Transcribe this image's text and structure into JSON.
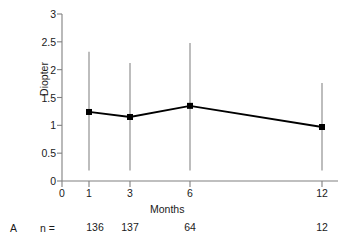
{
  "chart_data": {
    "type": "line",
    "title": "",
    "xlabel": "Months",
    "ylabel": "Diopter",
    "panel_label": "A",
    "x": [
      1,
      3,
      6,
      12
    ],
    "values": [
      1.24,
      1.15,
      1.35,
      0.97
    ],
    "error_low": [
      0.19,
      0.19,
      0.19,
      0.19
    ],
    "error_high": [
      2.32,
      2.12,
      2.48,
      1.76
    ],
    "xticks": [
      0,
      1,
      3,
      6,
      12
    ],
    "xtick_labels": [
      "0",
      "1",
      "3",
      "6",
      "12"
    ],
    "yticks": [
      0,
      0.5,
      1,
      1.5,
      2,
      2.5,
      3
    ],
    "ytick_labels": [
      "0",
      "0.5",
      "1",
      "1.5",
      "2",
      "2.5",
      "3"
    ],
    "xlim": [
      0,
      12
    ],
    "ylim": [
      0,
      3
    ],
    "grid": false,
    "legend": null,
    "marker": "square",
    "line_color": "#000000",
    "errorbar_color": "#9a9a9a",
    "axis_color": "#808080",
    "n_label_prefix": "n =",
    "n_counts": [
      "136",
      "137",
      "64",
      "12"
    ]
  }
}
